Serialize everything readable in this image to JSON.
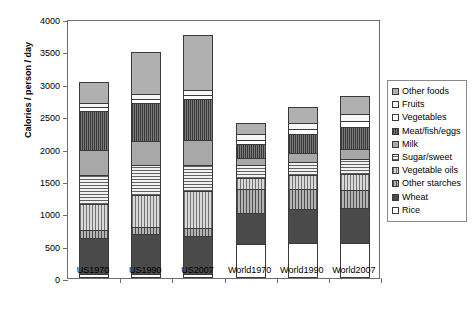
{
  "chart_data": {
    "type": "bar",
    "stacked": true,
    "title": "",
    "xlabel": "",
    "ylabel": "Calories / person / day",
    "ylim": [
      0,
      4000
    ],
    "ytick_step": 500,
    "yticks": [
      "0",
      "500",
      "1000",
      "1500",
      "2000",
      "2500",
      "3000",
      "3500",
      "4000"
    ],
    "grid": false,
    "legend_position": "right",
    "categories": [
      "US1970",
      "US1990",
      "US2007",
      "World1970",
      "World1990",
      "World2007"
    ],
    "series": [
      {
        "name": "Rice",
        "fill": "f-rice",
        "values": [
          60,
          60,
          60,
          520,
          540,
          540
        ]
      },
      {
        "name": "Wheat",
        "fill": "f-wheat",
        "values": [
          555,
          620,
          590,
          490,
          530,
          540
        ]
      },
      {
        "name": "Other starches",
        "fill": "f-otherstarch",
        "values": [
          130,
          115,
          120,
          360,
          300,
          280
        ]
      },
      {
        "name": "Vegetable oils",
        "fill": "f-vegoils",
        "values": [
          395,
          480,
          570,
          180,
          215,
          250
        ]
      },
      {
        "name": "Sugar/sweet",
        "fill": "f-sugar",
        "values": [
          450,
          465,
          410,
          190,
          210,
          225
        ]
      },
      {
        "name": "Milk",
        "fill": "f-milk",
        "values": [
          385,
          380,
          380,
          120,
          135,
          155
        ]
      },
      {
        "name": "Meat/fish/eggs",
        "fill": "f-meat",
        "values": [
          605,
          580,
          630,
          215,
          290,
          345
        ]
      },
      {
        "name": "Vegetables",
        "fill": "f-veg",
        "values": [
          55,
          65,
          70,
          60,
          80,
          95
        ]
      },
      {
        "name": "Fruits",
        "fill": "f-fruits",
        "values": [
          75,
          80,
          75,
          90,
          95,
          100
        ]
      },
      {
        "name": "Other foods",
        "fill": "f-otherfoods",
        "values": [
          320,
          645,
          845,
          175,
          255,
          280
        ]
      }
    ],
    "totals": [
      3030,
      3490,
      3750,
      2400,
      2650,
      2810
    ],
    "legend_order": [
      "Other foods",
      "Fruits",
      "Vegetables",
      "Meat/fish/eggs",
      "Milk",
      "Sugar/sweet",
      "Vegetable oils",
      "Other starches",
      "Wheat",
      "Rice"
    ]
  },
  "colors": {
    "axis": "#6e6e6e",
    "segment_border": "#3a3a3a",
    "background": "#ffffff",
    "text": "#000000"
  }
}
